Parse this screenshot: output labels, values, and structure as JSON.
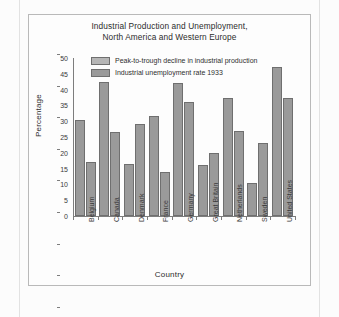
{
  "chart_data": {
    "type": "bar",
    "title": "Industrial Production and Unemployment, North America and Western Europe",
    "title_line1": "Industrial Production and Unemployment,",
    "title_line2": "North America and Western Europe",
    "xlabel": "Country",
    "ylabel": "Percentage",
    "ylim": [
      0,
      50
    ],
    "yticks": [
      0,
      5,
      10,
      15,
      20,
      25,
      30,
      35,
      40,
      45,
      50
    ],
    "grid": false,
    "legend_position": "top-left inside plot",
    "categories": [
      "Belgium",
      "Canada",
      "Denmark",
      "France",
      "Germany",
      "Great Britain",
      "Netherlands",
      "Sweden",
      "United States"
    ],
    "series": [
      {
        "name": "Peak-to-trough decline in industrial production",
        "values": [
          30.5,
          42.5,
          16.5,
          31.5,
          42,
          16,
          37.5,
          10.5,
          47
        ],
        "color": "#9a9a9a"
      },
      {
        "name": "Industrial unemployment rate 1933",
        "values": [
          17,
          26.5,
          29,
          14,
          36,
          20,
          27,
          23,
          37.5
        ],
        "color": "#9a9a9a"
      }
    ]
  },
  "colors": {
    "bar_fill": "#9a9a9a",
    "bar_stroke": "#6f6f6f",
    "axis": "#7d7d7d",
    "text": "#2c2c2c",
    "frame": "#b9b9b9",
    "background": "#fdfdfd"
  }
}
